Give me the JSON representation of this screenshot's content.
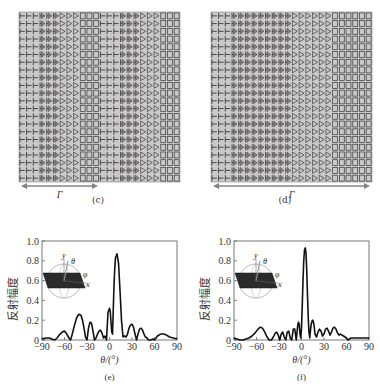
{
  "panels": [
    {
      "id": "c",
      "caption": "(c)",
      "type": "metasurface-array",
      "gamma_label": "Γ",
      "rows": 22,
      "pattern": [
        "bar",
        "bar",
        "bar",
        "arrow",
        "arrow",
        "arrow",
        "tri",
        "tri",
        "tri",
        "square",
        "square",
        "square",
        "bar",
        "bar",
        "bar",
        "arrow",
        "arrow",
        "arrow",
        "tri",
        "tri",
        "tri",
        "square",
        "square",
        "square"
      ],
      "colors": {
        "background": "#c9c9c9",
        "stroke": "#3a3a3a",
        "arrow": "#8a7f86"
      }
    },
    {
      "id": "d",
      "caption": "(d)",
      "type": "metasurface-array",
      "gamma_label": "Γ",
      "rows": 22,
      "pattern": [
        "bar",
        "bar",
        "bar",
        "arrow",
        "arrow",
        "arrow",
        "arrow",
        "arrow",
        "arrow",
        "arrow",
        "arrow",
        "arrow",
        "tri",
        "tri",
        "tri",
        "tri",
        "tri",
        "tri",
        "square",
        "square",
        "square",
        "square",
        "square",
        "square"
      ],
      "colors": {
        "background": "#c9c9c9",
        "stroke": "#3a3a3a",
        "arrow": "#8a7f86"
      }
    }
  ],
  "chart_data": [
    {
      "id": "e",
      "type": "line",
      "caption": "(e)",
      "xlabel": "θ/(°)",
      "ylabel": "反射幅度",
      "xlim": [
        -90,
        90
      ],
      "ylim": [
        0,
        1.0
      ],
      "xticks": [
        -90,
        -60,
        -30,
        0,
        30,
        60,
        90
      ],
      "yticks": [
        0,
        0.2,
        0.4,
        0.6,
        0.8,
        1.0
      ],
      "ytick_labels": [
        "0",
        "0.2",
        "0.4",
        "0.6",
        "0.8",
        "1.0"
      ],
      "grid": false,
      "inset_labels": {
        "y": "y",
        "theta": "θ",
        "phi": "φ",
        "x": "x"
      },
      "series": [
        {
          "name": "reflection",
          "x": [
            -90,
            -85,
            -80,
            -77,
            -73,
            -70,
            -66,
            -63,
            -60,
            -57,
            -54,
            -52,
            -50,
            -47,
            -44,
            -41,
            -38,
            -36,
            -34,
            -32,
            -30,
            -28,
            -26,
            -24,
            -22,
            -20,
            -18,
            -16,
            -14,
            -12,
            -10,
            -8,
            -6,
            -4,
            -2,
            0,
            1,
            2,
            3,
            4,
            5,
            6,
            7,
            8,
            10,
            12,
            14,
            16,
            18,
            19,
            20,
            22,
            24,
            26,
            28,
            30,
            32,
            34,
            36,
            38,
            40,
            42,
            44,
            46,
            48,
            50,
            52,
            55,
            58,
            60,
            64,
            68,
            72,
            76,
            80,
            85,
            90
          ],
          "values": [
            0.01,
            0.02,
            0.02,
            0.01,
            0.0,
            0.02,
            0.06,
            0.08,
            0.09,
            0.06,
            0.02,
            0.0,
            0.05,
            0.14,
            0.22,
            0.26,
            0.25,
            0.2,
            0.12,
            0.03,
            0.0,
            0.12,
            0.18,
            0.17,
            0.09,
            0.0,
            0.02,
            0.06,
            0.09,
            0.1,
            0.07,
            0.02,
            0.04,
            0.0,
            0.28,
            0.32,
            0.29,
            0.18,
            0.08,
            0.06,
            0.3,
            0.55,
            0.72,
            0.83,
            0.87,
            0.78,
            0.5,
            0.2,
            0.03,
            0.04,
            0.04,
            0.03,
            0.06,
            0.12,
            0.15,
            0.16,
            0.13,
            0.06,
            0.0,
            0.06,
            0.11,
            0.12,
            0.1,
            0.06,
            0.03,
            0.02,
            0.0,
            0.0,
            0.01,
            0.0,
            0.04,
            0.06,
            0.06,
            0.05,
            0.03,
            0.02,
            0.01
          ]
        }
      ]
    },
    {
      "id": "f",
      "type": "line",
      "caption": "(f)",
      "xlabel": "θ/(°)",
      "ylabel": "反射幅度",
      "xlim": [
        -90,
        90
      ],
      "ylim": [
        0,
        1.0
      ],
      "xticks": [
        -90,
        -60,
        -30,
        0,
        30,
        60,
        90
      ],
      "yticks": [
        0,
        0.2,
        0.4,
        0.6,
        0.8,
        1.0
      ],
      "ytick_labels": [
        "0",
        "0.2",
        "0.4",
        "0.6",
        "0.8",
        "1.0"
      ],
      "grid": false,
      "inset_labels": {
        "y": "y",
        "theta": "θ",
        "phi": "φ",
        "x": "x"
      },
      "series": [
        {
          "name": "reflection",
          "x": [
            -90,
            -86,
            -82,
            -78,
            -74,
            -70,
            -66,
            -62,
            -58,
            -55,
            -52,
            -49,
            -46,
            -43,
            -40,
            -37,
            -35,
            -33,
            -31,
            -29,
            -27,
            -25,
            -23,
            -21,
            -19,
            -17,
            -15,
            -13,
            -11,
            -9,
            -7,
            -5,
            -4,
            -3,
            -2,
            -1,
            0,
            1,
            2,
            3,
            4,
            5,
            6,
            7,
            8,
            9,
            10,
            11,
            12,
            13,
            14,
            15,
            16,
            17,
            18,
            20,
            22,
            24,
            26,
            28,
            30,
            32,
            34,
            36,
            38,
            40,
            42,
            44,
            46,
            48,
            50,
            52,
            54,
            56,
            58,
            60,
            62,
            64,
            66,
            70,
            75,
            80,
            85,
            90
          ],
          "values": [
            0.02,
            0.01,
            0.0,
            0.0,
            0.01,
            0.02,
            0.04,
            0.07,
            0.11,
            0.13,
            0.12,
            0.08,
            0.03,
            0.0,
            0.0,
            0.04,
            0.07,
            0.08,
            0.05,
            0.0,
            0.06,
            0.08,
            0.03,
            0.0,
            0.08,
            0.09,
            0.02,
            0.0,
            0.11,
            0.11,
            0.0,
            0.15,
            0.18,
            0.16,
            0.06,
            0.02,
            0.12,
            0.35,
            0.6,
            0.8,
            0.91,
            0.93,
            0.88,
            0.7,
            0.45,
            0.22,
            0.08,
            0.02,
            0.1,
            0.16,
            0.19,
            0.2,
            0.18,
            0.13,
            0.06,
            0.03,
            0.08,
            0.11,
            0.09,
            0.04,
            0.06,
            0.11,
            0.12,
            0.09,
            0.05,
            0.08,
            0.12,
            0.13,
            0.11,
            0.07,
            0.05,
            0.06,
            0.05,
            0.04,
            0.03,
            0.02,
            0.0,
            0.01,
            0.02,
            0.02,
            0.02,
            0.02,
            0.02,
            0.02
          ]
        }
      ]
    }
  ]
}
